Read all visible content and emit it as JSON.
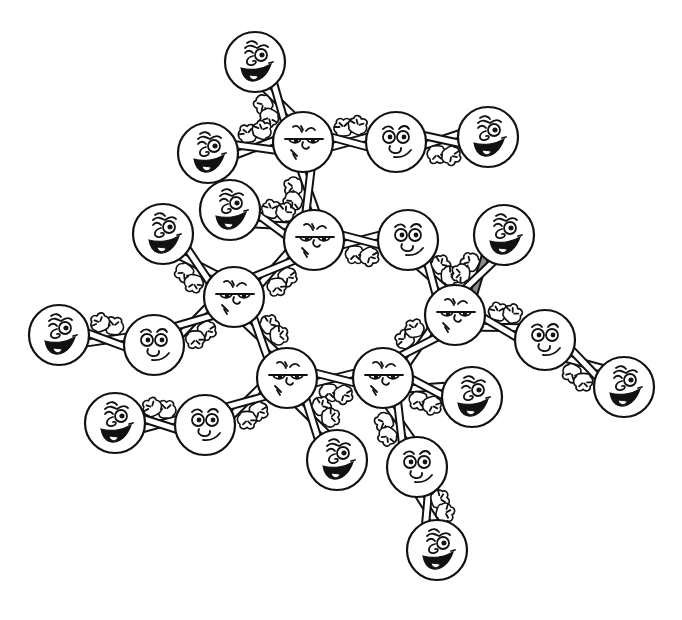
{
  "illustration": {
    "title": "Cartoon molecule of smiling circle characters holding hands",
    "background": "#ffffff",
    "ink_color": "#111111",
    "shaded_arm_color": "#8a8a8a"
  },
  "characters": [
    {
      "id": "h-top",
      "kind": "grin",
      "x": 255,
      "y": 62,
      "r": 30
    },
    {
      "id": "c-top",
      "kind": "grumpy",
      "x": 303,
      "y": 142,
      "r": 30
    },
    {
      "id": "o-top",
      "kind": "calm",
      "x": 396,
      "y": 142,
      "r": 30
    },
    {
      "id": "h-top-right",
      "kind": "grin",
      "x": 488,
      "y": 137,
      "r": 30
    },
    {
      "id": "h-left-upper",
      "kind": "grin",
      "x": 208,
      "y": 153,
      "r": 30
    },
    {
      "id": "h-left-mid",
      "kind": "grin",
      "x": 230,
      "y": 210,
      "r": 30
    },
    {
      "id": "c-upper-mid",
      "kind": "grumpy",
      "x": 314,
      "y": 240,
      "r": 30
    },
    {
      "id": "h-far-left",
      "kind": "grin",
      "x": 163,
      "y": 234,
      "r": 30
    },
    {
      "id": "o-mid-right",
      "kind": "calm",
      "x": 408,
      "y": 240,
      "r": 30
    },
    {
      "id": "h-right-upper",
      "kind": "grin",
      "x": 504,
      "y": 235,
      "r": 30
    },
    {
      "id": "c-left",
      "kind": "grumpy",
      "x": 234,
      "y": 297,
      "r": 30
    },
    {
      "id": "c-right",
      "kind": "grumpy",
      "x": 455,
      "y": 315,
      "r": 30
    },
    {
      "id": "h-edge-left",
      "kind": "grin",
      "x": 59,
      "y": 335,
      "r": 30
    },
    {
      "id": "o-left",
      "kind": "calm",
      "x": 154,
      "y": 345,
      "r": 30
    },
    {
      "id": "o-right",
      "kind": "calm",
      "x": 545,
      "y": 340,
      "r": 30
    },
    {
      "id": "c-bottom-left",
      "kind": "grumpy",
      "x": 287,
      "y": 378,
      "r": 30
    },
    {
      "id": "c-bottom-right",
      "kind": "grumpy",
      "x": 383,
      "y": 378,
      "r": 30
    },
    {
      "id": "h-bottom-right-mid",
      "kind": "grin",
      "x": 472,
      "y": 397,
      "r": 30
    },
    {
      "id": "h-edge-right",
      "kind": "grin",
      "x": 624,
      "y": 387,
      "r": 30
    },
    {
      "id": "h-lower-left",
      "kind": "grin",
      "x": 115,
      "y": 423,
      "r": 30
    },
    {
      "id": "o-lower-left",
      "kind": "calm",
      "x": 205,
      "y": 425,
      "r": 30
    },
    {
      "id": "h-bottom-mid",
      "kind": "grin",
      "x": 337,
      "y": 460,
      "r": 30
    },
    {
      "id": "o-bottom",
      "kind": "calm",
      "x": 417,
      "y": 467,
      "r": 30
    },
    {
      "id": "h-bottom",
      "kind": "grin",
      "x": 437,
      "y": 550,
      "r": 30
    }
  ],
  "bonds": [
    {
      "from": "h-top",
      "to": "c-top",
      "hands": true
    },
    {
      "from": "c-top",
      "to": "o-top",
      "hands": true
    },
    {
      "from": "o-top",
      "to": "h-top-right",
      "hands": true
    },
    {
      "from": "h-left-upper",
      "to": "c-top",
      "hands": true
    },
    {
      "from": "c-top",
      "to": "c-upper-mid",
      "hands": true
    },
    {
      "from": "h-left-mid",
      "to": "c-upper-mid",
      "hands": true
    },
    {
      "from": "c-upper-mid",
      "to": "o-mid-right",
      "hands": true
    },
    {
      "from": "c-upper-mid",
      "to": "c-left",
      "hands": true
    },
    {
      "from": "h-far-left",
      "to": "c-left",
      "hands": true
    },
    {
      "from": "o-mid-right",
      "to": "c-right",
      "hands": true
    },
    {
      "from": "h-right-upper",
      "to": "c-right",
      "hands": true,
      "shaded": true
    },
    {
      "from": "c-right",
      "to": "o-right",
      "hands": true
    },
    {
      "from": "o-right",
      "to": "h-edge-right",
      "hands": true
    },
    {
      "from": "c-left",
      "to": "o-left",
      "hands": true
    },
    {
      "from": "o-left",
      "to": "h-edge-left",
      "hands": true
    },
    {
      "from": "c-left",
      "to": "c-bottom-left",
      "hands": true
    },
    {
      "from": "c-bottom-left",
      "to": "c-bottom-right",
      "hands": true
    },
    {
      "from": "c-bottom-right",
      "to": "c-right",
      "hands": true
    },
    {
      "from": "c-bottom-right",
      "to": "h-bottom-right-mid",
      "hands": true
    },
    {
      "from": "c-bottom-left",
      "to": "o-lower-left",
      "hands": true
    },
    {
      "from": "o-lower-left",
      "to": "h-lower-left",
      "hands": true
    },
    {
      "from": "c-bottom-left",
      "to": "h-bottom-mid",
      "hands": true
    },
    {
      "from": "c-bottom-right",
      "to": "o-bottom",
      "hands": true
    },
    {
      "from": "o-bottom",
      "to": "h-bottom",
      "hands": true
    }
  ],
  "legend": {
    "grumpy": "Grumpy face with furrowed brows and half-closed eyes (ring members)",
    "calm": "Calm face with round eyes and an O-shaped nose/mouth",
    "grin": "Grinning face with wavy brow, curled nose, open mouth and tongue"
  }
}
